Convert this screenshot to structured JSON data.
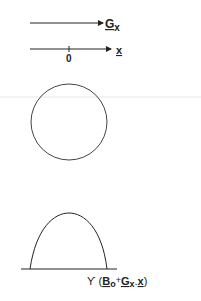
{
  "diagram": {
    "gradient_label": {
      "main": "G",
      "sub": "x"
    },
    "axis_label": "x",
    "origin_label": "0",
    "signal_label": {
      "prefix": "ϒ (",
      "b": "B",
      "b_sub": "o",
      "plus": "+",
      "g": "G",
      "g_sub": "x",
      "dot": ".",
      "x": "x",
      "suffix": ")"
    },
    "colors": {
      "stroke": "#333333",
      "divider": "#e6e6e6"
    }
  }
}
